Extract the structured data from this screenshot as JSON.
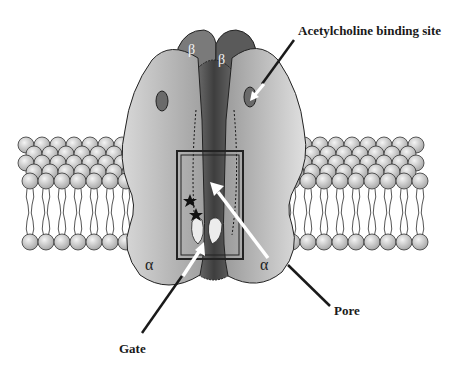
{
  "diagram": {
    "labels": {
      "acetylcholine_binding_site": "Acetylcholine binding site",
      "pore": "Pore",
      "gate": "Gate"
    },
    "subunits": {
      "beta_left": "β",
      "beta_right": "β",
      "alpha_left": "α",
      "alpha_right": "α"
    },
    "colors": {
      "background": "#ffffff",
      "alpha_fill": "#b8b8b8",
      "beta_fill": "#6e6e6e",
      "center_fill": "#4a4a4a",
      "lipid_head": "#d0d0d0",
      "outline": "#222222",
      "arrow_white": "#ffffff",
      "leader_line": "#1a1a1a"
    },
    "markers": {
      "stars": 2,
      "highlight_box": "gate region"
    }
  }
}
